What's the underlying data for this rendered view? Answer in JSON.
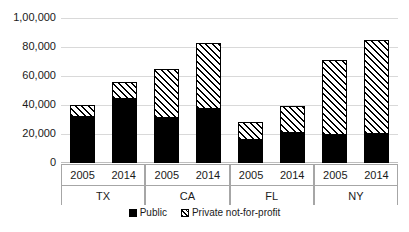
{
  "chart_data": {
    "type": "bar",
    "title": "",
    "xlabel": "",
    "ylabel": "",
    "stacked": true,
    "grid": true,
    "legend_position": "bottom",
    "ylim": [
      0,
      100000
    ],
    "yticks": [
      0,
      20000,
      40000,
      60000,
      80000,
      100000
    ],
    "ytick_labels": [
      "0",
      "20,000",
      "40,000",
      "60,000",
      "80,000",
      "1,00,000"
    ],
    "groups": [
      "TX",
      "CA",
      "FL",
      "NY"
    ],
    "years": [
      "2005",
      "2014"
    ],
    "categories": [
      "TX 2005",
      "TX 2014",
      "CA 2005",
      "CA 2014",
      "FL 2005",
      "FL 2014",
      "NY 2005",
      "NY 2014"
    ],
    "series": [
      {
        "name": "Public",
        "color": "#000000",
        "pattern": "solid",
        "values": [
          32000,
          44000,
          31000,
          37000,
          16000,
          21000,
          19000,
          20000
        ]
      },
      {
        "name": "Private not-for-profit",
        "color": "#000000",
        "pattern": "diagonal-hatch",
        "values": [
          8000,
          12000,
          34000,
          46000,
          12000,
          18000,
          52000,
          65000
        ]
      }
    ],
    "totals": [
      40000,
      56000,
      65000,
      83000,
      28000,
      39000,
      71000,
      85000
    ]
  },
  "legend": {
    "items": [
      {
        "label": "Public",
        "swatch": "solid-black-square"
      },
      {
        "label": "Private not-for-profit",
        "swatch": "hatched-square"
      }
    ]
  },
  "axis": {
    "y_labels": [
      "1,00,000",
      "80,000",
      "60,000",
      "40,000",
      "20,000",
      "0"
    ]
  }
}
